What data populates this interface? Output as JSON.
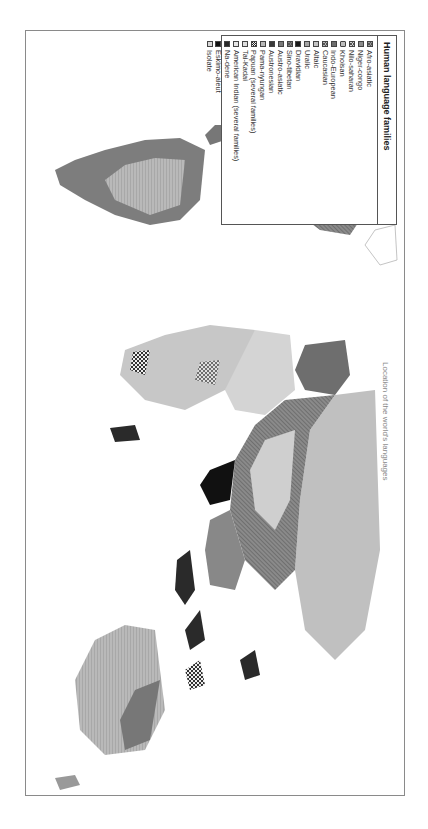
{
  "map": {
    "orientation": "rotated 90 degrees clockwise",
    "caption": "Location of the world's languages"
  },
  "legend": {
    "title": "Human language families",
    "items": [
      {
        "label": "Afro-asiatic",
        "pattern": "cross-hatch",
        "color": "#9a9a9a"
      },
      {
        "label": "Niger-congo",
        "pattern": "hatch",
        "color": "#8c8c8c"
      },
      {
        "label": "Nilo-saharan",
        "pattern": "cross",
        "color": "#d0d0d0"
      },
      {
        "label": "Khoisan",
        "pattern": "dotted-circle",
        "color": "#bdbdbd"
      },
      {
        "label": "Indo-European",
        "pattern": "solid",
        "color": "#6e6e6e"
      },
      {
        "label": "Caucasian",
        "pattern": "cross-hatch",
        "color": "#b5b5b5"
      },
      {
        "label": "Altaic",
        "pattern": "solid",
        "color": "#c4c4c4"
      },
      {
        "label": "Uralic",
        "pattern": "solid",
        "color": "#a6a6a6"
      },
      {
        "label": "Dravidian",
        "pattern": "solid",
        "color": "#1a1a1a"
      },
      {
        "label": "Sino-tibetan",
        "pattern": "cross-hatch",
        "color": "#808080"
      },
      {
        "label": "Austro-asiatic",
        "pattern": "solid",
        "color": "#7a7a7a"
      },
      {
        "label": "Austronesian",
        "pattern": "solid",
        "color": "#3a3a3a"
      },
      {
        "label": "Pama-nyungan",
        "pattern": "solid",
        "color": "#b8b8b8"
      },
      {
        "label": "Papuan (several families)",
        "pattern": "checker",
        "color": "#555555"
      },
      {
        "label": "Tai-Kadai",
        "pattern": "solid",
        "color": "#dedede"
      },
      {
        "label": "American Indian (several families)",
        "pattern": "solid",
        "color": "#e6e6e6"
      },
      {
        "label": "Na-dene",
        "pattern": "solid",
        "color": "#2a2a2a"
      },
      {
        "label": "Eskimo-aleut",
        "pattern": "solid",
        "color": "#111111"
      },
      {
        "label": "Isolate",
        "pattern": "solid",
        "color": "#d8d8d8"
      }
    ]
  }
}
